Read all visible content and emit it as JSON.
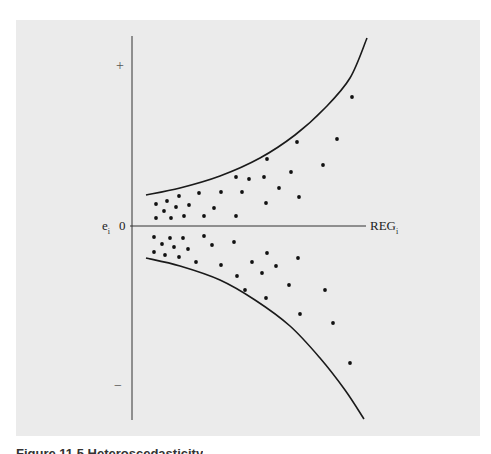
{
  "chart_data": {
    "type": "scatter",
    "title": "",
    "xlabel": "REG_i",
    "ylabel": "e_i",
    "y_zero_label": "0",
    "y_plus_label": "+",
    "y_minus_label": "−",
    "grid": false,
    "legend": null,
    "envelope": {
      "upper_curve_px": [
        [
          146,
          195
        ],
        [
          180,
          188
        ],
        [
          220,
          176
        ],
        [
          260,
          158
        ],
        [
          295,
          135
        ],
        [
          325,
          108
        ],
        [
          350,
          78
        ],
        [
          367,
          38
        ]
      ],
      "lower_curve_px": [
        [
          146,
          258
        ],
        [
          180,
          266
        ],
        [
          220,
          280
        ],
        [
          255,
          300
        ],
        [
          290,
          326
        ],
        [
          320,
          358
        ],
        [
          345,
          390
        ],
        [
          364,
          419
        ]
      ]
    },
    "points_px": [
      [
        352,
        97
      ],
      [
        337,
        139
      ],
      [
        297,
        142
      ],
      [
        323,
        165
      ],
      [
        267,
        159
      ],
      [
        291,
        172
      ],
      [
        236,
        177
      ],
      [
        249,
        179
      ],
      [
        264,
        177
      ],
      [
        279,
        188
      ],
      [
        299,
        197
      ],
      [
        242,
        192
      ],
      [
        221,
        192
      ],
      [
        199,
        193
      ],
      [
        266,
        203
      ],
      [
        214,
        208
      ],
      [
        236,
        216
      ],
      [
        204,
        216
      ],
      [
        184,
        216
      ],
      [
        171,
        218
      ],
      [
        156,
        218
      ],
      [
        156,
        204
      ],
      [
        167,
        201
      ],
      [
        179,
        196
      ],
      [
        189,
        205
      ],
      [
        176,
        207
      ],
      [
        164,
        211
      ],
      [
        154,
        237
      ],
      [
        170,
        238
      ],
      [
        183,
        238
      ],
      [
        204,
        236
      ],
      [
        234,
        242
      ],
      [
        162,
        244
      ],
      [
        174,
        247
      ],
      [
        188,
        249
      ],
      [
        212,
        245
      ],
      [
        154,
        252
      ],
      [
        165,
        255
      ],
      [
        179,
        257
      ],
      [
        196,
        262
      ],
      [
        221,
        265
      ],
      [
        252,
        262
      ],
      [
        267,
        253
      ],
      [
        298,
        258
      ],
      [
        276,
        266
      ],
      [
        237,
        276
      ],
      [
        262,
        273
      ],
      [
        289,
        285
      ],
      [
        245,
        290
      ],
      [
        266,
        298
      ],
      [
        325,
        290
      ],
      [
        300,
        314
      ],
      [
        333,
        323
      ],
      [
        350,
        363
      ]
    ],
    "axis_px": {
      "origin": [
        132,
        226
      ],
      "x_end": 366,
      "y_top": 36,
      "y_bottom": 420
    }
  },
  "labels": {
    "plus": "+",
    "minus": "−",
    "ei": "e",
    "ei_sub": "i",
    "zero": "0",
    "reg": "REG",
    "reg_sub": "i"
  },
  "caption": "Figure 11.5 Heteroscedasticity"
}
